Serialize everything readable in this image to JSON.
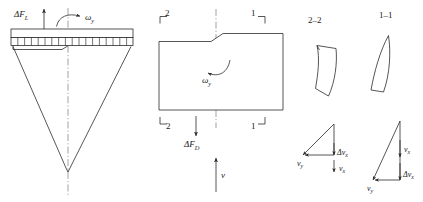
{
  "figure": {
    "name": "rotor-blade-aerodynamic-load-diagram",
    "stroke_color": "#2b2b2b",
    "centerline_color": "#8a8a8a",
    "background": "#ffffff"
  },
  "panel_left": {
    "name": "bladed-disc-elevation",
    "lift_label": "ΔF",
    "lift_subscript": "L",
    "omega_label": "ω",
    "omega_subscript": "y",
    "segment_count": 18
  },
  "panel_middle": {
    "name": "blade-plan-view",
    "section_top_left": "2",
    "section_top_right": "1",
    "section_bottom_left": "2",
    "section_bottom_right": "1",
    "omega_label": "ω",
    "omega_subscript": "y",
    "drag_label": "ΔF",
    "drag_subscript": "D",
    "velocity_label": "v"
  },
  "panel_sections": {
    "name": "airfoil-cross-sections",
    "section_2_label": "2–2",
    "section_1_label": "1–1"
  },
  "panel_triangles": {
    "name": "velocity-triangles",
    "left": {
      "name": "velocity-triangle-section-2",
      "delta_vx_label": "Δv",
      "delta_vx_subscript": "x",
      "vx_label": "v",
      "vx_subscript": "x",
      "vy_label": "v",
      "vy_subscript": "y"
    },
    "right": {
      "name": "velocity-triangle-section-1",
      "vx_label": "v",
      "vx_subscript": "x",
      "delta_vx_label": "Δv",
      "delta_vx_subscript": "x",
      "vy_label": "v",
      "vy_subscript": "y"
    }
  }
}
